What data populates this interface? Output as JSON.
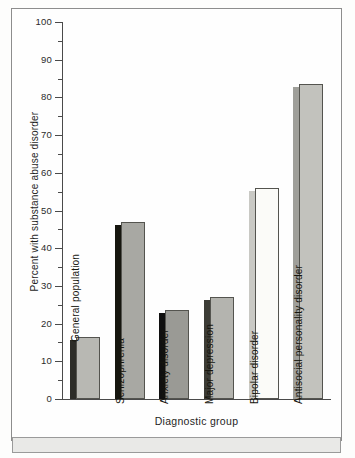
{
  "chart_data": {
    "type": "bar",
    "title": "",
    "xlabel": "Diagnostic group",
    "ylabel": "Percent with substance abuse disorder",
    "ylim": [
      0,
      100
    ],
    "ytick_step": 10,
    "yminor_step": 5,
    "grid": false,
    "legend": "none",
    "yticks": [
      "0",
      "10",
      "20",
      "30",
      "40",
      "50",
      "60",
      "70",
      "80",
      "90",
      "100"
    ],
    "categories": [
      "General population",
      "Schizophrenia",
      "Anxiety disorder",
      "Major depression",
      "Bipolar disorder",
      "Antisocial personality disorder"
    ],
    "values": [
      16.5,
      47,
      23.5,
      27,
      56,
      83.5
    ],
    "bar_face_colors": [
      "#b8b8b3",
      "#a8a8a3",
      "#9a9a95",
      "#b4b4af",
      "#fbfbf8",
      "#c2c2bd"
    ],
    "bar_side_colors": [
      "#2c2c28",
      "#16160f",
      "#101010",
      "#3c3c36",
      "#c9c9c4",
      "#9f9f9a"
    ],
    "label_inside": [
      false,
      true,
      true,
      true,
      true,
      true
    ]
  },
  "figure": {
    "frame_color": "#8d8d8d",
    "axis_color": "#4a4a4a",
    "plot_background": "#fefefe",
    "band_background": "#e9e9e7"
  }
}
